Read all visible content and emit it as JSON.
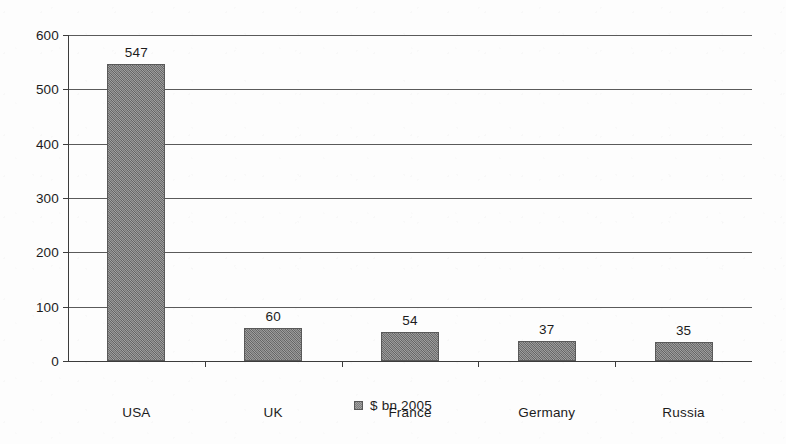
{
  "chart_data": {
    "type": "bar",
    "title": "",
    "subtitle": "",
    "xlabel": "",
    "ylabel": "",
    "categories": [
      "USA",
      "UK",
      "France",
      "Germany",
      "Russia"
    ],
    "values": [
      547,
      60,
      54,
      37,
      35
    ],
    "series": [
      {
        "name": "$ bn 2005",
        "values": [
          547,
          60,
          54,
          37,
          35
        ],
        "color": "#7d7d7d"
      }
    ],
    "ylim": [
      0,
      600
    ],
    "ytick_values": [
      0,
      100,
      200,
      300,
      400,
      500,
      600
    ],
    "ytick_labels": [
      "0",
      "100",
      "200",
      "300",
      "400",
      "500",
      "600"
    ],
    "data_labels": [
      "547",
      "60",
      "54",
      "37",
      "35"
    ],
    "grid": "horizontal",
    "legend": {
      "position": "bottom",
      "entries": [
        {
          "label": "$ bn 2005",
          "swatch_name": "legend-swatch-dollars-bn-2005"
        }
      ]
    },
    "bar_fill_color": "#7d7d7d",
    "axis_color": "#3c3c3c",
    "gridline_color": "#5a5a5a",
    "text_color": "#1c1c1c",
    "background_color": "#fdfdfd"
  }
}
